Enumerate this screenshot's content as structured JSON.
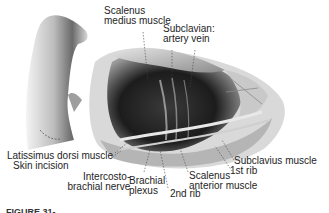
{
  "figure": {
    "labels": {
      "scalenus_medius": "Scalenus\nmedius muscle",
      "scalenus_medius_line1": "Scalenus",
      "scalenus_medius_line2": "medius muscle",
      "subclavian_line1": "Subclavian:",
      "subclavian_line2": "artery vein",
      "latissimus_dorsi": "Latissimus dorsi muscle",
      "skin_incision": "Skin incision",
      "intercosto_line1": "Intercosto-",
      "intercosto_line2": "brachial nerve",
      "brachial_line1": "Brachial",
      "brachial_line2": "plexus",
      "second_rib": "2nd rib",
      "scalenus_anterior_line1": "Scalenus",
      "scalenus_anterior_line2": "anterior muscle",
      "subclavius": "Subclavius muscle",
      "first_rib": "1st rib"
    },
    "caption": "FIGURE 31-"
  }
}
